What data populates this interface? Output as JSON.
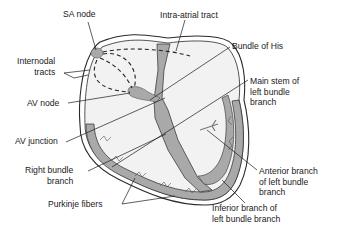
{
  "diagram": {
    "colors": {
      "tissue": "#a9a9a9",
      "tissue_dark": "#8a8a8a",
      "chamber": "#f2f2f2",
      "outline": "#2a2a2a",
      "text": "#1a1a1a"
    },
    "labels": {
      "sa_node": "SA node",
      "intra_atrial_tract": "Intra-atrial tract",
      "internodal_tracts": "Internodal\ntracts",
      "bundle_of_his": "Bundle of His",
      "av_node": "AV node",
      "main_stem_lbb": "Main stem of\nleft bundle\nbranch",
      "av_junction": "AV junction",
      "right_bundle_branch": "Right bundle\nbranch",
      "anterior_branch_lbb": "Anterior branch\nof left bundle\nbranch",
      "purkinje_fibers": "Purkinje fibers",
      "inferior_branch_lbb": "Inferior branch of\nleft bundle branch"
    }
  }
}
